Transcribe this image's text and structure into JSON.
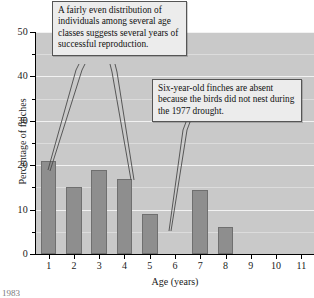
{
  "chart_data": {
    "type": "bar",
    "title": "",
    "subtitle": "",
    "xlabel": "Age (years)",
    "ylabel": "Percentage of finches",
    "categories": [
      "1",
      "2",
      "3",
      "4",
      "5",
      "6",
      "7",
      "8",
      "9",
      "10",
      "11"
    ],
    "values": [
      21,
      15,
      19,
      17,
      9,
      0,
      14.5,
      6,
      0,
      0,
      0
    ],
    "series": [
      {
        "name": "Percentage of finches",
        "values": [
          21,
          15,
          19,
          17,
          9,
          0,
          14.5,
          6,
          0,
          0,
          0
        ]
      }
    ],
    "xlim": [
      0.5,
      11.5
    ],
    "ylim": [
      0,
      50
    ],
    "y_major_ticks": [
      0,
      10,
      20,
      30,
      40,
      50
    ],
    "y_minor_ticks": [
      5,
      15,
      25,
      35,
      45
    ],
    "y_tick_labels": [
      "0",
      "10",
      "20",
      "30",
      "40",
      "50"
    ],
    "grid": true,
    "grid_orientation": "horizontal",
    "legend": false,
    "legend_position": "none",
    "bar_color": "#8e8e8e",
    "plot_background": "#c9c9c9",
    "gridline_color": "#f2f2f2",
    "annotations": [
      {
        "id": "callout-reproduction",
        "text": "A fairly even distribution of individuals among several age classes suggests several years of successful reproduction.",
        "points_to": [
          "1",
          "4"
        ]
      },
      {
        "id": "callout-drought",
        "text": "Six-year-old finches are absent because the birds did not nest during the 1977 drought.",
        "points_to": [
          "6"
        ]
      }
    ]
  },
  "figure": {
    "x_axis_title": "Age (years)",
    "y_axis_title": "Percentage of finches",
    "footnote": "1983"
  },
  "callouts": {
    "reproduction": "A fairly even distribution of individuals among several age classes suggests several years of successful reproduction.",
    "drought": "Six-year-old finches are absent because the birds did not nest during the 1977 drought."
  }
}
